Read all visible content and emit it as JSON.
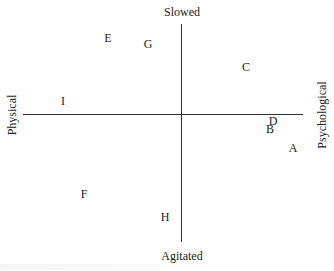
{
  "diagram": {
    "type": "quadrant",
    "axes": {
      "top": "Slowed",
      "bottom": "Agitated",
      "left": "Physical",
      "right": "Psychological"
    },
    "points": [
      {
        "label": "A",
        "x": 293,
        "y": 148
      },
      {
        "label": "B",
        "x": 270,
        "y": 129
      },
      {
        "label": "C",
        "x": 246,
        "y": 67
      },
      {
        "label": "D",
        "x": 273,
        "y": 121
      },
      {
        "label": "E",
        "x": 108,
        "y": 38
      },
      {
        "label": "F",
        "x": 84,
        "y": 194
      },
      {
        "label": "G",
        "x": 148,
        "y": 44
      },
      {
        "label": "H",
        "x": 165,
        "y": 217
      },
      {
        "label": "I",
        "x": 63,
        "y": 101
      }
    ]
  }
}
